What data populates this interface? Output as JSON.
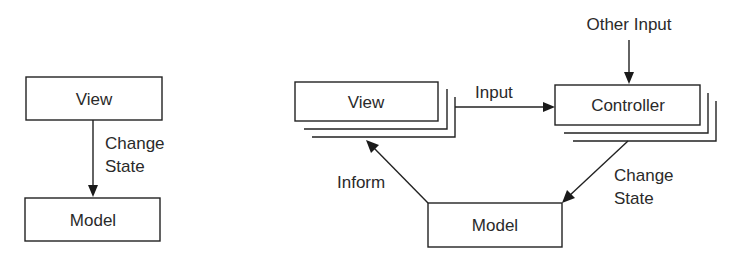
{
  "colors": {
    "stroke": "#222222",
    "text": "#2a2a2a",
    "background": "#ffffff"
  },
  "left_diagram": {
    "view_box": {
      "label": "View"
    },
    "model_box": {
      "label": "Model"
    },
    "arrow_label": {
      "line1": "Change",
      "line2": "State"
    }
  },
  "right_diagram": {
    "view_box": {
      "label": "View",
      "stacked": true
    },
    "controller_box": {
      "label": "Controller",
      "stacked": true
    },
    "model_box": {
      "label": "Model"
    },
    "input_arrow_label": "Input",
    "other_input_label": "Other Input",
    "change_state_label": {
      "line1": "Change",
      "line2": "State"
    },
    "inform_label": "Inform"
  }
}
